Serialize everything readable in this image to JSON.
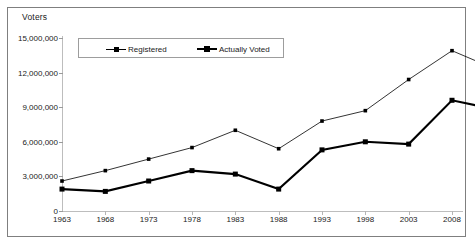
{
  "chart_data": {
    "type": "line",
    "title": "",
    "ylabel": "Voters",
    "xlabel": "",
    "grid": false,
    "legend_position": "top-left-inside",
    "ylim": [
      0,
      15000000
    ],
    "yticks": [
      "0",
      "3,000,000",
      "6,000,000",
      "9,000,000",
      "12,000,000",
      "15,000,000"
    ],
    "ytick_values": [
      0,
      3000000,
      6000000,
      9000000,
      12000000,
      15000000
    ],
    "xticks": [
      "1963",
      "1968",
      "1973",
      "1978",
      "1983",
      "1988",
      "1993",
      "1998",
      "2003",
      "2008"
    ],
    "x": [
      1963,
      1968,
      1973,
      1978,
      1983,
      1988,
      1993,
      1998,
      2003,
      2008,
      2013
    ],
    "series": [
      {
        "name": "Registered",
        "style": "thin",
        "color": "#000000",
        "values": [
          2600000,
          3500000,
          4500000,
          5500000,
          7000000,
          5400000,
          7800000,
          8700000,
          11400000,
          13900000,
          12300000
        ]
      },
      {
        "name": "Actually Voted",
        "style": "thick",
        "color": "#000000",
        "values": [
          1900000,
          1700000,
          2600000,
          3500000,
          3200000,
          1900000,
          5300000,
          6000000,
          5800000,
          9600000,
          8800000
        ]
      }
    ]
  },
  "axis": {
    "title": "Voters"
  },
  "legend": {
    "items": [
      {
        "label": "Registered"
      },
      {
        "label": "Actually Voted"
      }
    ]
  }
}
